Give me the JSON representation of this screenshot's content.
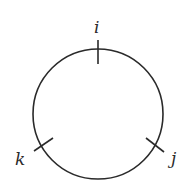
{
  "diagram": {
    "type": "circle-with-marked-points",
    "stroke_color": "#2a2a2a",
    "background": "#ffffff",
    "circle": {
      "cx": 98,
      "cy": 114,
      "r": 65
    },
    "points": [
      {
        "label": "i",
        "position": "top"
      },
      {
        "label": "j",
        "position": "lower-right"
      },
      {
        "label": "k",
        "position": "lower-left"
      }
    ]
  }
}
